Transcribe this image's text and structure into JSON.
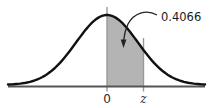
{
  "figure": {
    "labels": {
      "annotation": "0.4066",
      "x_tick_center": "0",
      "x_tick_z": "z"
    },
    "colors": {
      "curve": "#111111",
      "shade": "#b4b4b4",
      "axis": "#555555",
      "guide_lines": "#999999",
      "arrow": "#222222"
    },
    "chart_data": {
      "type": "area",
      "subtype": "standard-normal-distribution-curve",
      "title": "",
      "xlabel": "",
      "ylabel": "",
      "x_tick_labels": [
        "0",
        "z"
      ],
      "curve": "symmetric bell curve centered at 0, tails approaching horizontal axis",
      "shaded_region": {
        "from_label": "0",
        "to_label": "z",
        "area_value": 0.4066,
        "fill": "#b4b4b4"
      },
      "annotations": [
        {
          "text": "0.4066",
          "meaning": "probability area between 0 and z",
          "arrow": "curved leader from label pointing down into shaded region"
        }
      ],
      "legend": "none",
      "grid": false
    }
  }
}
